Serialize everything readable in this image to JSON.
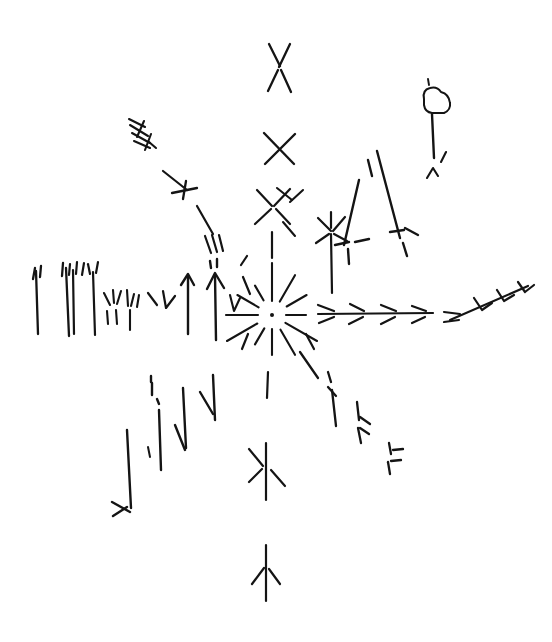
{
  "image": {
    "title": "Hand-drawn radial starburst sketch",
    "medium": "pen and ink line drawing",
    "background_color": "#ffffff",
    "ink_color": "#141414",
    "width": 552,
    "height": 642
  },
  "composition": {
    "center_label": "central starburst",
    "center_x": 272,
    "center_y": 315,
    "description": "A central dot surrounded by radiating short rays, with eight arms of stylized marks extending outward in the cardinal and diagonal directions."
  },
  "elements": {
    "center_burst": {
      "name": "central starburst",
      "dot_radius": 2,
      "ray_count": 12,
      "inner_radius": 14,
      "outer_radius": 52
    },
    "north_arm": {
      "name": "upper vertical arm",
      "marks": [
        {
          "type": "bowtie-x",
          "cx": 280,
          "cy": 64
        },
        {
          "type": "cross-x",
          "cx": 279,
          "cy": 148
        },
        {
          "type": "asterisk-x",
          "cx": 272,
          "cy": 205
        },
        {
          "type": "stem",
          "x": 272,
          "y1": 232,
          "y2": 262
        }
      ]
    },
    "south_arm": {
      "name": "lower vertical arm",
      "marks": [
        {
          "type": "stem",
          "x": 267,
          "y1": 368,
          "y2": 398
        },
        {
          "type": "asterisk-arrow",
          "cx": 266,
          "cy": 468
        },
        {
          "type": "asterisk-arrow",
          "cx": 266,
          "cy": 570
        }
      ]
    },
    "west_arm": {
      "name": "left horizontal arm of grass strokes",
      "stroke_count": 6,
      "description": "Tall vertical grass-like strokes with small tufts at their tops, decreasing toward the center, plus a cluster of short scattered ticks."
    },
    "east_arm": {
      "name": "right horizontal arm",
      "marks": [
        {
          "type": "feathered-line",
          "x1": 316,
          "y1": 314,
          "x2": 432,
          "y2": 313
        },
        {
          "type": "feathered-arrow",
          "x1": 446,
          "y1": 322,
          "x2": 528,
          "y2": 288
        }
      ]
    },
    "northwest_arm": {
      "name": "upper-left diagonal branch",
      "marks": [
        {
          "type": "hatch-group",
          "cx": 140,
          "cy": 133
        },
        {
          "type": "cross-tick",
          "cx": 183,
          "cy": 190
        },
        {
          "type": "hatch-group",
          "cx": 212,
          "cy": 243
        }
      ]
    },
    "northeast_arm": {
      "name": "upper-right diagonal branch",
      "marks": [
        {
          "type": "asterisk-stem",
          "cx": 330,
          "cy": 232
        },
        {
          "type": "long-mast",
          "x1": 358,
          "y1": 175,
          "x2": 345,
          "y2": 252
        },
        {
          "type": "long-mast",
          "x1": 375,
          "y1": 152,
          "x2": 400,
          "y2": 243
        },
        {
          "type": "bird-on-pole",
          "cx": 432,
          "cy": 100
        }
      ]
    },
    "southwest_arm": {
      "name": "lower-left diagonal branch of down-arrows",
      "arrow_count": 4,
      "description": "Four vertical strokes with small barbs reading as downward arrows, lengthening toward the lower left."
    },
    "southeast_arm": {
      "name": "lower-right diagonal branch",
      "marks": [
        {
          "type": "barbed-stroke",
          "cx": 332,
          "cy": 395
        },
        {
          "type": "barbed-stroke",
          "cx": 357,
          "cy": 425
        },
        {
          "type": "barbed-stroke",
          "cx": 390,
          "cy": 455
        }
      ]
    },
    "bird": {
      "name": "bird perched on pole",
      "body_x": 432,
      "body_y": 98,
      "pole_top": 112,
      "pole_bottom": 158
    }
  }
}
